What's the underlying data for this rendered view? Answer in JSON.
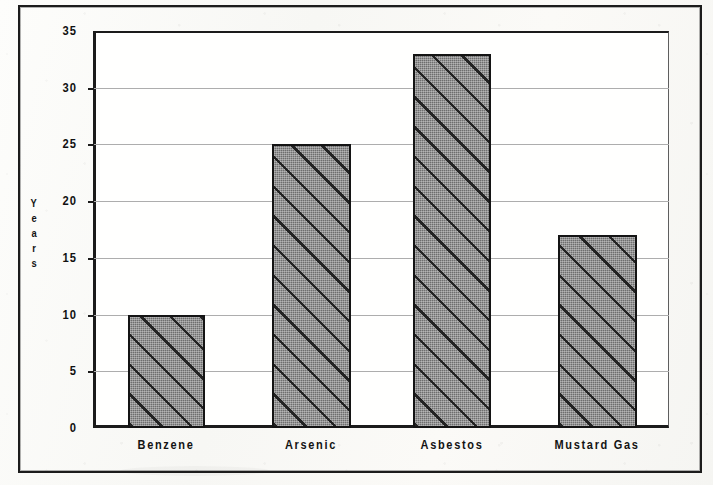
{
  "chart_data": {
    "type": "bar",
    "title": "",
    "xlabel": "",
    "ylabel": "Years",
    "categories": [
      "Benzene",
      "Arsenic",
      "Asbestos",
      "Mustard Gas"
    ],
    "values": [
      10,
      25,
      33,
      17
    ],
    "ylim": [
      0,
      35
    ],
    "yticks": [
      0,
      5,
      10,
      15,
      20,
      25,
      30,
      35
    ],
    "ytick_labels": [
      "0",
      "5",
      "10",
      "15",
      "20",
      "25",
      "30",
      "35"
    ],
    "grid": true,
    "legend": "none",
    "bar_fill": "#6e6e6e",
    "bar_hatch": "diagonal-stripes-45",
    "bar_edge_color": "#141414",
    "gridline_color": "#adadad",
    "axis_color": "#1b1b1b",
    "plot_background": "#fffffe",
    "page_background": "#fbfbf9"
  },
  "axis": {
    "y_title_letters": [
      "Y",
      "e",
      "a",
      "r",
      "s"
    ]
  },
  "frame": {
    "style": "double-rule-border"
  }
}
